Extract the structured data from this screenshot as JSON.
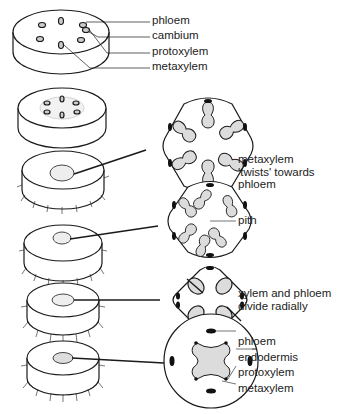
{
  "figure": {
    "top_labels": [
      "phloem",
      "cambium",
      "protoxylem",
      "metaxylem"
    ],
    "stage_notes": {
      "twist": [
        "metaxylem",
        "'twists' towards",
        "phloem"
      ],
      "pith": "pith",
      "divide": [
        "xylem and phloem",
        "divide radially"
      ]
    },
    "bottom_labels": [
      "phloem",
      "endodermis",
      "protoxylem",
      "metaxylem"
    ],
    "colors": {
      "line": "#1a1a1a",
      "fill": "#dcdcdc",
      "dark": "#111111"
    }
  }
}
